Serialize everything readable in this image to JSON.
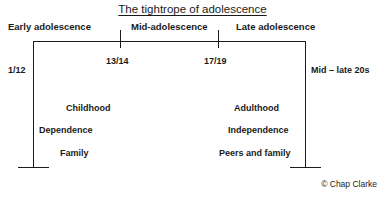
{
  "title": "The tightrope of adolescence",
  "stages": [
    {
      "label": "Early adolescence"
    },
    {
      "label": "Mid-adolescence"
    },
    {
      "label": "Late adolescence"
    }
  ],
  "age_markers": [
    {
      "label": "1/12"
    },
    {
      "label": "13/14"
    },
    {
      "label": "17/19"
    },
    {
      "label": "Mid – late 20s"
    }
  ],
  "left_column": [
    {
      "label": "Childhood"
    },
    {
      "label": "Dependence"
    },
    {
      "label": "Family"
    }
  ],
  "right_column": [
    {
      "label": "Adulthood"
    },
    {
      "label": "Independence"
    },
    {
      "label": "Peers and family"
    }
  ],
  "copyright": "© Chap Clarke",
  "colors": {
    "ink": "#1a1a1a",
    "background": "#ffffff"
  }
}
